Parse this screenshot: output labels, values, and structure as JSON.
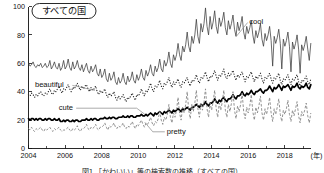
{
  "figure": {
    "title_badge": "すべての国",
    "caption": "図1 「かわいい」等の検索数の推移（すべての国）"
  },
  "chart_data": {
    "type": "line",
    "title": "すべての国",
    "xlabel": "(年)",
    "ylabel": "",
    "xlim": [
      2004,
      2019.4
    ],
    "ylim": [
      0,
      100
    ],
    "grid": false,
    "legend": "inline-annotations",
    "x_tick_labels": [
      "2004",
      "2006",
      "2008",
      "2010",
      "2012",
      "2014",
      "2016",
      "2018"
    ],
    "x_ticks": [
      2004,
      2006,
      2008,
      2010,
      2012,
      2014,
      2016,
      2018
    ],
    "x_minor_ticks": [
      2005,
      2007,
      2009,
      2011,
      2013,
      2015,
      2017,
      2019
    ],
    "y_tick_labels": [
      "0",
      "20",
      "40",
      "60",
      "80",
      "100"
    ],
    "y_ticks": [
      0,
      20,
      40,
      60,
      80,
      100
    ],
    "x_unit": "(年)",
    "x_start": 2004.0,
    "x_step": 0.0833333,
    "series": [
      {
        "name": "cool",
        "style": "thin-solid",
        "label_x": 2016.05,
        "label_y": 88,
        "values": [
          60,
          58,
          59,
          61,
          58,
          57,
          59,
          58,
          60,
          57,
          58,
          60,
          57,
          58,
          62,
          56,
          58,
          61,
          57,
          56,
          60,
          55,
          57,
          62,
          56,
          58,
          63,
          57,
          55,
          61,
          56,
          58,
          62,
          57,
          55,
          59,
          54,
          57,
          60,
          55,
          53,
          58,
          54,
          56,
          59,
          53,
          51,
          56,
          50,
          52,
          56,
          49,
          47,
          53,
          48,
          50,
          54,
          47,
          45,
          50,
          46,
          48,
          53,
          47,
          45,
          51,
          47,
          49,
          54,
          48,
          46,
          52,
          48,
          51,
          56,
          50,
          48,
          55,
          51,
          54,
          59,
          53,
          51,
          58,
          54,
          57,
          63,
          56,
          54,
          62,
          58,
          61,
          68,
          60,
          57,
          66,
          62,
          66,
          74,
          66,
          62,
          72,
          68,
          73,
          82,
          72,
          68,
          79,
          74,
          80,
          91,
          79,
          74,
          88,
          82,
          88,
          99,
          86,
          80,
          93,
          84,
          89,
          97,
          86,
          81,
          92,
          86,
          90,
          96,
          85,
          80,
          90,
          84,
          88,
          94,
          84,
          79,
          89,
          83,
          87,
          93,
          82,
          77,
          86,
          81,
          85,
          90,
          80,
          74,
          83,
          78,
          82,
          88,
          77,
          72,
          81,
          76,
          80,
          86,
          76,
          58,
          79,
          74,
          78,
          84,
          74,
          56,
          77,
          72,
          76,
          82,
          72,
          54,
          75,
          70,
          74,
          80,
          70,
          53,
          73,
          69,
          73,
          79,
          70,
          62,
          74,
          71,
          75,
          81,
          72,
          66,
          78
        ]
      },
      {
        "name": "beautiful",
        "style": "dotted",
        "label_x": 2004.35,
        "label_y": 43,
        "values": [
          38,
          37,
          39,
          38,
          36,
          38,
          37,
          39,
          40,
          38,
          37,
          39,
          38,
          40,
          42,
          39,
          38,
          41,
          40,
          42,
          44,
          41,
          39,
          42,
          41,
          43,
          45,
          42,
          40,
          43,
          42,
          44,
          46,
          43,
          41,
          44,
          42,
          44,
          45,
          42,
          40,
          43,
          41,
          42,
          44,
          40,
          38,
          41,
          39,
          40,
          42,
          38,
          36,
          39,
          37,
          38,
          40,
          36,
          34,
          37,
          35,
          36,
          38,
          35,
          33,
          36,
          35,
          37,
          39,
          36,
          34,
          38,
          37,
          39,
          42,
          39,
          37,
          41,
          40,
          43,
          46,
          42,
          40,
          44,
          43,
          45,
          48,
          44,
          42,
          46,
          45,
          47,
          50,
          46,
          43,
          47,
          45,
          47,
          49,
          45,
          43,
          47,
          46,
          48,
          50,
          46,
          44,
          48,
          47,
          49,
          52,
          48,
          46,
          50,
          49,
          51,
          54,
          50,
          47,
          51,
          50,
          52,
          55,
          51,
          48,
          52,
          51,
          53,
          56,
          51,
          49,
          53,
          51,
          53,
          55,
          51,
          48,
          52,
          50,
          52,
          54,
          50,
          47,
          51,
          50,
          52,
          54,
          50,
          47,
          51,
          49,
          51,
          53,
          49,
          46,
          50,
          49,
          51,
          53,
          49,
          46,
          50,
          49,
          51,
          53,
          48,
          45,
          49,
          48,
          50,
          52,
          48,
          45,
          49,
          48,
          50,
          52,
          47,
          44,
          48,
          47,
          49,
          51,
          47,
          45,
          49,
          48,
          50,
          52,
          48,
          46,
          50
        ]
      },
      {
        "name": "cute",
        "style": "thick-solid",
        "label_x": 2005.65,
        "label_y": 27,
        "values": [
          21,
          20,
          21,
          21,
          20,
          21,
          20,
          21,
          21,
          20,
          20,
          21,
          20,
          21,
          21,
          20,
          20,
          21,
          20,
          20,
          21,
          19,
          19,
          20,
          19,
          20,
          20,
          19,
          19,
          20,
          19,
          20,
          20,
          19,
          19,
          20,
          20,
          20,
          21,
          20,
          20,
          21,
          20,
          21,
          21,
          20,
          20,
          21,
          21,
          21,
          22,
          21,
          21,
          22,
          21,
          22,
          22,
          21,
          21,
          22,
          22,
          22,
          23,
          22,
          22,
          23,
          22,
          23,
          23,
          22,
          22,
          23,
          23,
          23,
          24,
          23,
          23,
          24,
          23,
          24,
          25,
          24,
          23,
          25,
          24,
          25,
          26,
          25,
          24,
          26,
          25,
          26,
          27,
          26,
          25,
          27,
          26,
          27,
          28,
          27,
          26,
          28,
          27,
          28,
          29,
          28,
          27,
          29,
          29,
          30,
          31,
          30,
          29,
          31,
          30,
          31,
          33,
          31,
          30,
          32,
          32,
          33,
          35,
          33,
          32,
          34,
          33,
          35,
          36,
          34,
          33,
          35,
          35,
          36,
          38,
          36,
          35,
          37,
          37,
          38,
          40,
          38,
          37,
          39,
          38,
          39,
          41,
          39,
          38,
          40,
          40,
          41,
          42,
          40,
          39,
          41,
          41,
          42,
          44,
          42,
          40,
          43,
          42,
          43,
          45,
          43,
          41,
          44,
          43,
          44,
          45,
          43,
          41,
          44,
          43,
          44,
          46,
          43,
          42,
          44,
          43,
          44,
          46,
          43,
          42,
          45,
          44,
          45,
          46,
          44,
          43,
          45
        ]
      },
      {
        "name": "pretty",
        "style": "dashed",
        "label_x": 2011.55,
        "label_y": 10,
        "values": [
          14,
          13,
          15,
          13,
          12,
          14,
          13,
          14,
          15,
          13,
          12,
          14,
          13,
          14,
          15,
          13,
          12,
          14,
          13,
          14,
          15,
          13,
          12,
          13,
          13,
          14,
          15,
          13,
          12,
          14,
          13,
          14,
          16,
          13,
          12,
          14,
          14,
          15,
          17,
          14,
          13,
          15,
          14,
          15,
          17,
          14,
          13,
          15,
          15,
          16,
          18,
          15,
          13,
          16,
          15,
          16,
          18,
          15,
          14,
          16,
          15,
          16,
          18,
          15,
          14,
          16,
          15,
          17,
          19,
          16,
          14,
          17,
          16,
          18,
          20,
          17,
          15,
          18,
          17,
          19,
          22,
          18,
          16,
          19,
          18,
          21,
          26,
          20,
          17,
          22,
          20,
          24,
          31,
          22,
          18,
          25,
          22,
          27,
          36,
          25,
          20,
          29,
          25,
          31,
          40,
          27,
          21,
          31,
          26,
          32,
          41,
          28,
          22,
          32,
          27,
          33,
          42,
          28,
          22,
          32,
          27,
          33,
          41,
          28,
          22,
          32,
          27,
          33,
          41,
          27,
          22,
          31,
          26,
          32,
          40,
          27,
          21,
          30,
          26,
          31,
          39,
          26,
          21,
          29,
          25,
          30,
          38,
          26,
          20,
          29,
          25,
          30,
          37,
          25,
          20,
          28,
          24,
          29,
          36,
          25,
          19,
          28,
          24,
          29,
          35,
          24,
          19,
          27,
          24,
          28,
          34,
          24,
          19,
          27,
          23,
          28,
          33,
          23,
          18,
          26,
          23,
          27,
          32,
          23,
          18,
          25,
          22,
          26,
          30,
          22,
          18,
          24
        ]
      }
    ]
  }
}
